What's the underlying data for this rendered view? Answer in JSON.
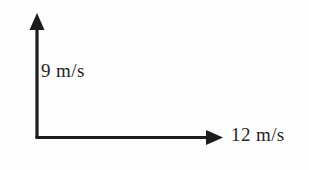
{
  "figure": {
    "background_color": "#fdfdfd",
    "stroke_color": "#1c1c1c",
    "text_color": "#262626"
  },
  "vectors": {
    "vertical": {
      "label": "9 m/s",
      "magnitude": 9,
      "unit": "m/s",
      "direction": "up",
      "arrowhead": "solid-triangle"
    },
    "horizontal": {
      "label": "12 m/s",
      "magnitude": 12,
      "unit": "m/s",
      "direction": "right",
      "arrowhead": "solid-triangle"
    }
  },
  "icons": {
    "up_arrowhead": "arrow-up-icon",
    "right_arrowhead": "arrow-right-icon"
  }
}
